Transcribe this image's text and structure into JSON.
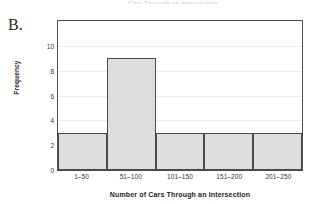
{
  "figure": {
    "part_label": "B.",
    "title_remnant": "Cars Through an Intersection"
  },
  "colors": {
    "bar_fill": "#dddddd",
    "bar_stroke": "#4a4a4a",
    "grid": "#ececec",
    "axis_text": "#333333",
    "plot_background": "#ffffff"
  },
  "chart_data": {
    "type": "bar",
    "title": "",
    "subtitle": "",
    "xlabel": "Number of Cars Through an Intersection",
    "ylabel": "Frequency",
    "categories": [
      "1–50",
      "51–100",
      "101–150",
      "151–200",
      "201–250"
    ],
    "values": [
      3,
      9,
      3,
      3,
      3
    ],
    "yticks": [
      0,
      2,
      4,
      6,
      8,
      10
    ],
    "ytick_labels": [
      "0",
      "2",
      "4",
      "6",
      "8",
      "10"
    ],
    "ylim": [
      0,
      12
    ],
    "xlim_categories": 5,
    "grid": "horizontal",
    "legend": "none",
    "bar_gap": 0
  }
}
